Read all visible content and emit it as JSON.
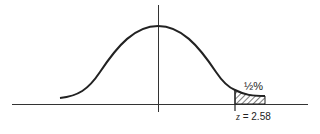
{
  "diagram": {
    "type": "normal-distribution-curve",
    "shaded_region": "right tail",
    "tail_label": "½%",
    "cutoff_label_var": "z",
    "cutoff_label_eq": "=",
    "cutoff_value": "2.58",
    "colors": {
      "line": "#222222",
      "background": "#ffffff"
    }
  }
}
